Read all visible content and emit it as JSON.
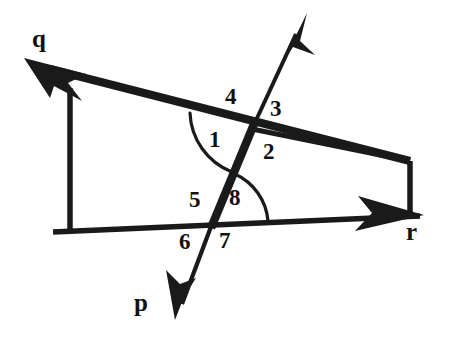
{
  "figure": {
    "kind": "geometry-diagram",
    "background_color": "#ffffff",
    "ink_color": "#1a1a1a",
    "width": 450,
    "height": 338
  },
  "ray_labels": [
    {
      "id": "q",
      "text": "q",
      "x": 32,
      "y": 26
    },
    {
      "id": "r",
      "text": "r",
      "x": 406,
      "y": 219
    },
    {
      "id": "p",
      "text": "p",
      "x": 134,
      "y": 290
    }
  ],
  "angle_labels": [
    {
      "id": "angle-1",
      "text": "1",
      "x": 209,
      "y": 128
    },
    {
      "id": "angle-2",
      "text": "2",
      "x": 263,
      "y": 140
    },
    {
      "id": "angle-3",
      "text": "3",
      "x": 270,
      "y": 97
    },
    {
      "id": "angle-4",
      "text": "4",
      "x": 225,
      "y": 85
    },
    {
      "id": "angle-5",
      "text": "5",
      "x": 189,
      "y": 188
    },
    {
      "id": "angle-6",
      "text": "6",
      "x": 179,
      "y": 230
    },
    {
      "id": "angle-7",
      "text": "7",
      "x": 219,
      "y": 229
    },
    {
      "id": "angle-8",
      "text": "8",
      "x": 229,
      "y": 186
    }
  ],
  "geometry": {
    "intersection_upper": {
      "x": 252,
      "y": 129
    },
    "intersection_lower": {
      "x": 212,
      "y": 224
    },
    "line_q": {
      "x1": 38,
      "y1": 72,
      "x2": 410,
      "y2": 161,
      "label": "q"
    },
    "line_r": {
      "x1": 53,
      "y1": 232,
      "x2": 424,
      "y2": 215,
      "label": "r"
    },
    "transversal": {
      "x1": 305,
      "y1": 18,
      "x2": 175,
      "y2": 318,
      "labels": [
        "p"
      ]
    },
    "connector_left": {
      "x1": 70,
      "y1": 88,
      "x2": 70,
      "y2": 231
    },
    "connector_right": {
      "x1": 410,
      "y1": 161,
      "x2": 410,
      "y2": 216
    },
    "arcs": [
      {
        "id": "arc-1",
        "center_label": "1"
      },
      {
        "id": "arc-8",
        "center_label": "8"
      }
    ]
  }
}
